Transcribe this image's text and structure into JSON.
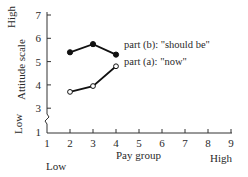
{
  "chart_data": {
    "type": "line",
    "title": "",
    "xlabel": "Pay group",
    "ylabel": "Attitude scale",
    "x_low_label": "Low",
    "x_high_label": "High",
    "y_low_label": "Low",
    "y_high_label": "High",
    "xlim": [
      1,
      9
    ],
    "ylim": [
      1,
      7
    ],
    "y_axis_break": true,
    "x_ticks": [
      "1",
      "2",
      "3",
      "4",
      "5",
      "6",
      "7",
      "8",
      "9"
    ],
    "y_ticks": [
      "1",
      "3",
      "4",
      "5",
      "6",
      "7"
    ],
    "grid": false,
    "legend_position": "inline-right-of-lines",
    "x": [
      2,
      3,
      4
    ],
    "series": [
      {
        "name": "part (b): \"should be\"",
        "marker": "filled-circle",
        "values": [
          5.4,
          5.75,
          5.3
        ]
      },
      {
        "name": "part (a): \"now\"",
        "marker": "open-circle",
        "values": [
          3.7,
          3.95,
          4.8
        ]
      }
    ]
  },
  "labels": {
    "series_b": "part (b): \"should be\"",
    "series_a": "part (a): \"now\""
  }
}
